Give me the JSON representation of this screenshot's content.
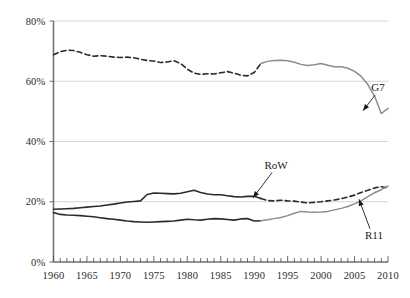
{
  "chart_data": {
    "type": "line",
    "title": "",
    "xlabel": "",
    "ylabel": "",
    "xlim": [
      1960,
      2010
    ],
    "ylim": [
      0,
      80
    ],
    "ytick_values": [
      0,
      20,
      40,
      60,
      80
    ],
    "ytick_labels": [
      "0%",
      "20%",
      "40%",
      "60%",
      "80%"
    ],
    "xtick_labels": [
      "1960",
      "1965",
      "1970",
      "1975",
      "1980",
      "1985",
      "1990",
      "1995",
      "2000",
      "2005",
      "2010"
    ],
    "xtick_values": [
      1960,
      1965,
      1970,
      1975,
      1980,
      1985,
      1990,
      1995,
      2000,
      2005,
      2010
    ],
    "minor_xticks_every": 1,
    "grid": "horizontal",
    "legend": "none",
    "annotations": [
      {
        "text": "G7",
        "x": 2010,
        "y": 58
      },
      {
        "text": "RoW",
        "x": 1996,
        "y": 31
      },
      {
        "text": "R11",
        "x": 2010,
        "y": 9
      }
    ],
    "series": [
      {
        "name": "G7",
        "style_before_1991": "dashed",
        "style_after_1991": "solid",
        "color_before_1991": "#2b2b2b",
        "color_after_1991": "#8c8c8c",
        "x": [
          1960,
          1961,
          1962,
          1963,
          1964,
          1965,
          1966,
          1967,
          1968,
          1969,
          1970,
          1971,
          1972,
          1973,
          1974,
          1975,
          1976,
          1977,
          1978,
          1979,
          1980,
          1981,
          1982,
          1983,
          1984,
          1985,
          1986,
          1987,
          1988,
          1989,
          1990,
          1991,
          1992,
          1993,
          1994,
          1995,
          1996,
          1997,
          1998,
          1999,
          2000,
          2001,
          2002,
          2003,
          2004,
          2005,
          2006,
          2007,
          2008,
          2009,
          2010
        ],
        "y": [
          68.8,
          69.8,
          70.3,
          70.2,
          69.6,
          68.8,
          68.3,
          68.5,
          68.3,
          68.0,
          67.9,
          68.0,
          67.8,
          67.3,
          66.9,
          66.7,
          66.2,
          66.4,
          66.8,
          65.9,
          64.0,
          62.7,
          62.3,
          62.5,
          62.4,
          62.8,
          63.2,
          62.7,
          62.0,
          61.8,
          62.9,
          65.9,
          66.6,
          66.9,
          67.0,
          66.8,
          66.3,
          65.6,
          65.2,
          65.5,
          65.9,
          65.3,
          64.8,
          64.8,
          64.3,
          63.3,
          61.6,
          58.9,
          55.0,
          49.3,
          51.0
        ]
      },
      {
        "name": "RoW",
        "style_before_1991": "solid",
        "style_after_1991": "dashed",
        "color_before_1991": "#2b2b2b",
        "color_after_1991": "#2b2b2b",
        "x": [
          1960,
          1961,
          1962,
          1963,
          1964,
          1965,
          1966,
          1967,
          1968,
          1969,
          1970,
          1971,
          1972,
          1973,
          1974,
          1975,
          1976,
          1977,
          1978,
          1979,
          1980,
          1981,
          1982,
          1983,
          1984,
          1985,
          1986,
          1987,
          1988,
          1989,
          1990,
          1991,
          1992,
          1993,
          1994,
          1995,
          1996,
          1997,
          1998,
          1999,
          2000,
          2001,
          2002,
          2003,
          2004,
          2005,
          2006,
          2007,
          2008,
          2009,
          2010
        ],
        "y": [
          17.5,
          17.6,
          17.7,
          17.8,
          18.0,
          18.2,
          18.4,
          18.6,
          18.9,
          19.2,
          19.6,
          19.9,
          20.1,
          20.3,
          22.4,
          22.9,
          22.8,
          22.7,
          22.6,
          22.8,
          23.3,
          23.8,
          23.1,
          22.6,
          22.3,
          22.3,
          22.0,
          21.7,
          21.6,
          21.8,
          21.8,
          21.1,
          20.4,
          20.3,
          20.5,
          20.3,
          20.2,
          19.9,
          19.6,
          19.8,
          20.0,
          20.3,
          20.6,
          21.0,
          21.6,
          22.2,
          23.1,
          23.8,
          24.6,
          25.0,
          24.6
        ]
      },
      {
        "name": "R11",
        "style_before_1991": "solid",
        "style_after_1991": "solid",
        "color_before_1991": "#2b2b2b",
        "color_after_1991": "#8c8c8c",
        "x": [
          1960,
          1961,
          1962,
          1963,
          1964,
          1965,
          1966,
          1967,
          1968,
          1969,
          1970,
          1971,
          1972,
          1973,
          1974,
          1975,
          1976,
          1977,
          1978,
          1979,
          1980,
          1981,
          1982,
          1983,
          1984,
          1985,
          1986,
          1987,
          1988,
          1989,
          1990,
          1991,
          1992,
          1993,
          1994,
          1995,
          1996,
          1997,
          1998,
          1999,
          2000,
          2001,
          2002,
          2003,
          2004,
          2005,
          2006,
          2007,
          2008,
          2009,
          2010
        ],
        "y": [
          16.4,
          15.8,
          15.6,
          15.5,
          15.4,
          15.2,
          15.0,
          14.7,
          14.4,
          14.2,
          13.9,
          13.6,
          13.4,
          13.3,
          13.2,
          13.3,
          13.4,
          13.5,
          13.6,
          13.9,
          14.2,
          14.0,
          13.9,
          14.2,
          14.4,
          14.3,
          14.1,
          13.9,
          14.3,
          14.4,
          13.6,
          13.7,
          14.0,
          14.4,
          14.8,
          15.4,
          16.2,
          16.8,
          16.6,
          16.5,
          16.6,
          16.8,
          17.3,
          17.8,
          18.4,
          19.3,
          20.4,
          21.7,
          23.0,
          24.0,
          25.2
        ]
      }
    ]
  }
}
